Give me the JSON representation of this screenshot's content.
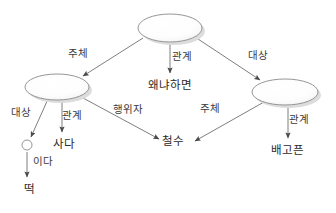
{
  "diagram": {
    "type": "semantic-network-graph",
    "background_color": "#ffffff",
    "line_color": "#6b6b6b",
    "text_color": "#2b2b2b",
    "ellipse_fill": "#fbfbfb",
    "ellipse_stroke": "#8a8a8a",
    "shadow_color": "#d8d8d8",
    "nodes": [
      {
        "id": "top",
        "shape": "ellipse",
        "label": "",
        "cx": 170,
        "cy": 28,
        "rx": 32,
        "ry": 14
      },
      {
        "id": "left",
        "shape": "ellipse",
        "label": "",
        "cx": 57,
        "cy": 87,
        "rx": 32,
        "ry": 13
      },
      {
        "id": "right",
        "shape": "ellipse",
        "label": "",
        "cx": 285,
        "cy": 92,
        "rx": 33,
        "ry": 13
      },
      {
        "id": "small",
        "shape": "circle",
        "label": "",
        "cx": 27,
        "cy": 145,
        "rx": 5,
        "ry": 5
      }
    ],
    "leaves": [
      {
        "id": "leaf-waenyahamyeon",
        "text": "왜냐하면",
        "x": 148,
        "y": 80
      },
      {
        "id": "leaf-sada",
        "text": "사다",
        "x": 53,
        "y": 139
      },
      {
        "id": "leaf-ida",
        "text": "이다",
        "x": 33,
        "y": 157
      },
      {
        "id": "leaf-tteok",
        "text": "떡",
        "x": 24,
        "y": 184
      },
      {
        "id": "leaf-cheolsu",
        "text": "철수",
        "x": 162,
        "y": 136
      },
      {
        "id": "leaf-baegopeun",
        "text": "배고픈",
        "x": 271,
        "y": 145
      }
    ],
    "edges": [
      {
        "id": "edge-top-left",
        "label": "주체",
        "label_x": 68,
        "label_y": 49,
        "from": "top",
        "to": "left",
        "x1": 143,
        "y1": 38,
        "x2": 82,
        "y2": 76
      },
      {
        "id": "edge-top-why",
        "label": "관계",
        "label_x": 172,
        "label_y": 52,
        "from": "top",
        "to": "leaf-waenyahamyeon",
        "x1": 170,
        "y1": 42,
        "x2": 170,
        "y2": 74
      },
      {
        "id": "edge-top-right",
        "label": "대상",
        "label_x": 248,
        "label_y": 51,
        "from": "top",
        "to": "right",
        "x1": 198,
        "y1": 39,
        "x2": 261,
        "y2": 81
      },
      {
        "id": "edge-left-small",
        "label": "대상",
        "label_x": 11,
        "label_y": 108,
        "from": "left",
        "to": "small",
        "x1": 47,
        "y1": 100,
        "x2": 31,
        "y2": 138
      },
      {
        "id": "edge-left-sada",
        "label": "관계",
        "label_x": 62,
        "label_y": 111,
        "from": "left",
        "to": "leaf-sada",
        "x1": 62,
        "y1": 100,
        "x2": 62,
        "y2": 133
      },
      {
        "id": "edge-left-cheolsu",
        "label": "행위자",
        "label_x": 113,
        "label_y": 105,
        "from": "left",
        "to": "leaf-cheolsu",
        "x1": 82,
        "y1": 99,
        "x2": 158,
        "y2": 136
      },
      {
        "id": "edge-small-tteok",
        "label": "이다",
        "label_x": 33,
        "label_y": 157,
        "from": "small",
        "to": "leaf-tteok",
        "x1": 27,
        "y1": 152,
        "x2": 27,
        "y2": 178
      },
      {
        "id": "edge-right-cheolsu",
        "label": "주체",
        "label_x": 200,
        "label_y": 104,
        "from": "right",
        "to": "leaf-cheolsu",
        "x1": 264,
        "y1": 102,
        "x2": 196,
        "y2": 140
      },
      {
        "id": "edge-right-baegopeun",
        "label": "관계",
        "label_x": 289,
        "label_y": 115,
        "from": "right",
        "to": "leaf-baegopeun",
        "x1": 288,
        "y1": 105,
        "x2": 288,
        "y2": 139
      }
    ]
  }
}
